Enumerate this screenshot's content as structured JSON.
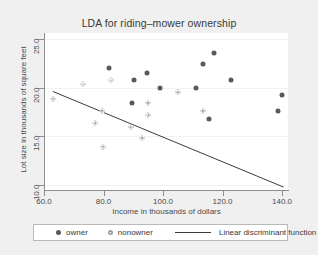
{
  "chart_data": {
    "type": "scatter",
    "title": "LDA for riding–mower ownership",
    "xlabel": "Income in thousands of dollars",
    "ylabel": "Lot size in thousands of square feet",
    "xlim": [
      60.0,
      142.0
    ],
    "ylim": [
      9.5,
      25.6
    ],
    "xticks": [
      "60.0",
      "80.0",
      "100.0",
      "120.0",
      "140.0"
    ],
    "xtick_values": [
      60.0,
      80.0,
      100.0,
      120.0,
      140.0
    ],
    "yticks": [
      "10.0",
      "15.0",
      "20.0",
      "25.0"
    ],
    "ytick_values": [
      10.0,
      15.0,
      20.0,
      25.0
    ],
    "grid": "horizontal",
    "legend_position": "bottom",
    "series": [
      {
        "name": "owner",
        "marker": "filled-circle",
        "color": "#595963",
        "points": [
          [
            82.0,
            22.0
          ],
          [
            90.3,
            20.8
          ],
          [
            94.5,
            21.5
          ],
          [
            89.5,
            18.4
          ],
          [
            99.0,
            20.0
          ],
          [
            111.0,
            20.0
          ],
          [
            113.5,
            22.4
          ],
          [
            117.0,
            23.6
          ],
          [
            123.0,
            20.8
          ],
          [
            115.5,
            16.8
          ],
          [
            138.5,
            17.6
          ],
          [
            140.0,
            19.2
          ]
        ]
      },
      {
        "name": "nonowner",
        "marker": "open-circle",
        "color": "#9a9aa4",
        "points": [
          [
            63.0,
            18.8
          ],
          [
            73.0,
            20.4
          ],
          [
            77.0,
            16.4
          ],
          [
            79.5,
            17.6
          ],
          [
            79.8,
            13.9
          ],
          [
            82.5,
            20.8
          ],
          [
            89.3,
            16.0
          ],
          [
            92.8,
            14.8
          ],
          [
            94.8,
            17.2
          ],
          [
            95.0,
            18.4
          ],
          [
            105.0,
            19.6
          ],
          [
            113.5,
            17.6
          ]
        ]
      }
    ],
    "annotations": [
      {
        "name": "Linear discriminant function",
        "type": "line",
        "color": "#3c3c3c",
        "x": [
          63.0,
          140.5
        ],
        "y": [
          19.6,
          9.8
        ]
      }
    ],
    "legend_entries": [
      {
        "label": "owner",
        "glyph": "filled-circle"
      },
      {
        "label": "nonowner",
        "glyph": "open-circle"
      },
      {
        "label": "Linear discriminant function",
        "glyph": "line"
      }
    ]
  }
}
